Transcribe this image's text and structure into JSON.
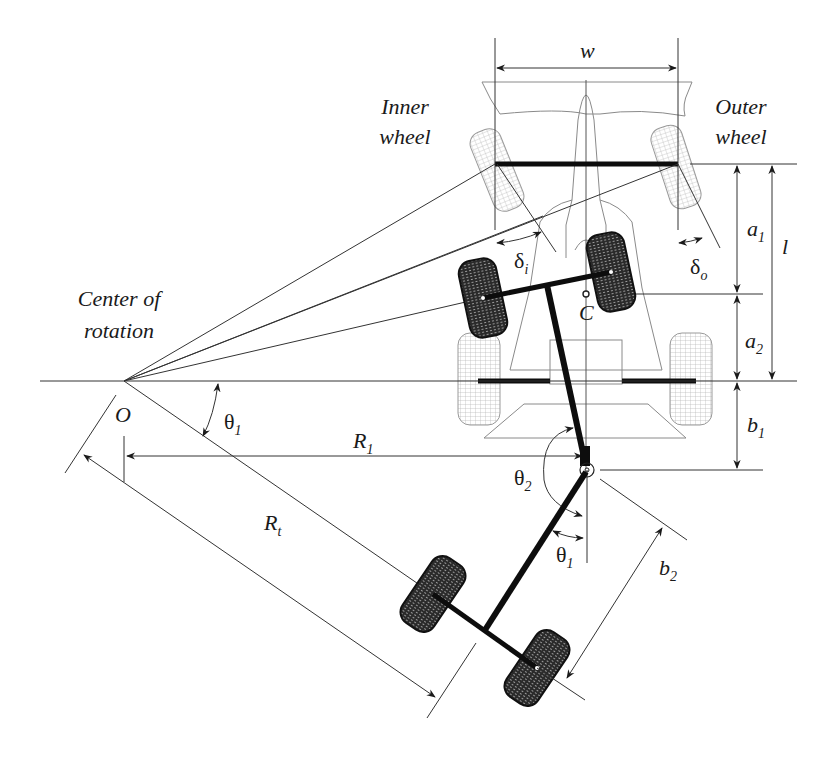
{
  "diagram": {
    "labels": {
      "inner_wheel_line1": "Inner",
      "inner_wheel_line2": "wheel",
      "outer_wheel_line1": "Outer",
      "outer_wheel_line2": "wheel",
      "center_line1": "Center of",
      "center_line2": "rotation",
      "origin": "O",
      "mass_center": "C",
      "track_width": "w",
      "wheelbase": "l",
      "a1": {
        "base": "a",
        "sub": "1"
      },
      "a2": {
        "base": "a",
        "sub": "2"
      },
      "b1": {
        "base": "b",
        "sub": "1"
      },
      "b2": {
        "base": "b",
        "sub": "2"
      },
      "R1": {
        "base": "R",
        "sub": "1"
      },
      "Rt": {
        "base": "R",
        "sub": "t"
      },
      "delta_i": {
        "base": "δ",
        "sub": "i"
      },
      "delta_o": {
        "base": "δ",
        "sub": "o"
      },
      "theta1_left": {
        "base": "θ",
        "sub": "1"
      },
      "theta1_hitch": {
        "base": "θ",
        "sub": "1"
      },
      "theta2": {
        "base": "θ",
        "sub": "2"
      }
    },
    "colors": {
      "line": "#333333",
      "thick": "#0d0d0d",
      "ghost": "#8a8a8a",
      "tire_dark": "#1e1e1e",
      "tire_light": "#bdbdbd",
      "background": "#ffffff"
    }
  }
}
